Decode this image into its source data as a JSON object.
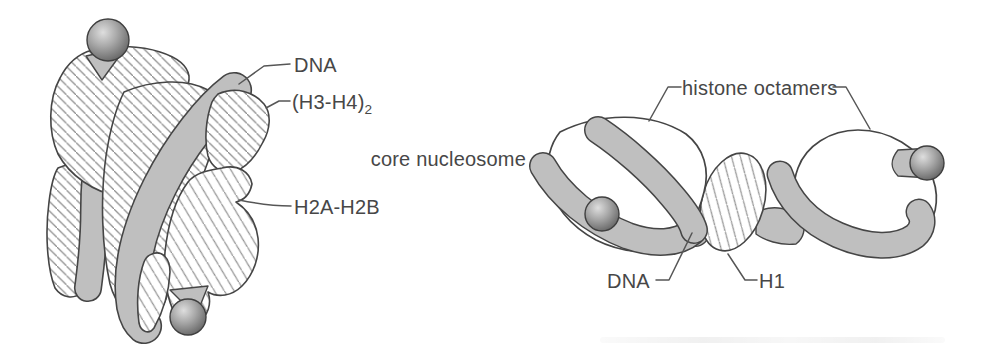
{
  "figure": {
    "left_panel": {
      "name": "core nucleosome detail view",
      "labels": {
        "dna": "DNA",
        "h3h4_main": "(H3-H4)",
        "h3h4_sub": "2",
        "h2a_h2b": "H2A-H2B"
      }
    },
    "right_panel": {
      "name": "nucleosome chain view",
      "labels": {
        "core_nucleosome": "core nucleosome",
        "histone_octamers": "histone octamers",
        "dna": "DNA",
        "h1": "H1"
      }
    },
    "colors": {
      "background": "#ffffff",
      "outline": "#454545",
      "dna_band": "#bfbfbf",
      "hatch_line": "#8d8d8d",
      "label_text": "#474747",
      "sphere_highlight": "#dedede",
      "sphere_shadow": "#616161"
    }
  }
}
